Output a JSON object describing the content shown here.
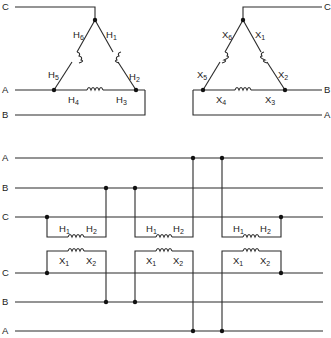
{
  "top_left_delta": {
    "title": "Primary delta (H)",
    "line_labels": {
      "c": "C",
      "a": "A",
      "b": "B"
    },
    "terminals": [
      {
        "id": "h1",
        "letter": "H",
        "num": "1"
      },
      {
        "id": "h2",
        "letter": "H",
        "num": "2"
      },
      {
        "id": "h3",
        "letter": "H",
        "num": "3"
      },
      {
        "id": "h4",
        "letter": "H",
        "num": "4"
      },
      {
        "id": "h5",
        "letter": "H",
        "num": "5"
      },
      {
        "id": "h6",
        "letter": "H",
        "num": "6"
      }
    ]
  },
  "top_right_delta": {
    "title": "Secondary delta (X)",
    "line_labels": {
      "c": "C",
      "b": "B",
      "a": "A"
    },
    "terminals": [
      {
        "id": "x1",
        "letter": "X",
        "num": "1"
      },
      {
        "id": "x2",
        "letter": "X",
        "num": "2"
      },
      {
        "id": "x3",
        "letter": "X",
        "num": "3"
      },
      {
        "id": "x4",
        "letter": "X",
        "num": "4"
      },
      {
        "id": "x5",
        "letter": "X",
        "num": "5"
      },
      {
        "id": "x6",
        "letter": "X",
        "num": "6"
      }
    ]
  },
  "bank": {
    "primary_bus_labels": [
      "A",
      "B",
      "C"
    ],
    "secondary_bus_labels": [
      "C",
      "B",
      "A"
    ],
    "transformers": [
      {
        "h1": "H",
        "h1n": "1",
        "h2": "H",
        "h2n": "2",
        "x1": "X",
        "x1n": "1",
        "x2": "X",
        "x2n": "2"
      },
      {
        "h1": "H",
        "h1n": "1",
        "h2": "H",
        "h2n": "2",
        "x1": "X",
        "x1n": "1",
        "x2": "X",
        "x2n": "2"
      },
      {
        "h1": "H",
        "h1n": "1",
        "h2": "H",
        "h2n": "2",
        "x1": "X",
        "x1n": "1",
        "x2": "X",
        "x2n": "2"
      }
    ]
  }
}
